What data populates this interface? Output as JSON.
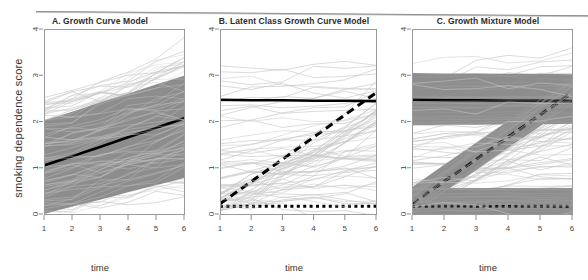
{
  "figure": {
    "width": 588,
    "height": 280,
    "background": "#ffffff",
    "band_color": "#8d8d8d",
    "spaghetti_color": "#c9c9c9",
    "mean_line_color": "#000000"
  },
  "panels": [
    {
      "id": "panel-a",
      "title": "A. Growth Curve Model",
      "xlabel": "time",
      "ylabel": "smoking dependence score"
    },
    {
      "id": "panel-b",
      "title": "B. Latent Class Growth Curve Model",
      "xlabel": "time",
      "ylabel": ""
    },
    {
      "id": "panel-c",
      "title": "C. Growth Mixture Model",
      "xlabel": "time",
      "ylabel": ""
    }
  ],
  "axes": {
    "x_ticks": [
      "1",
      "2",
      "3",
      "4",
      "5",
      "6"
    ],
    "y_ticks": [
      "0",
      "1",
      "2",
      "3",
      "4"
    ],
    "xlim": [
      1,
      6
    ],
    "ylim": [
      0,
      4
    ],
    "grid": false,
    "legend": "none"
  },
  "chart_data": {
    "type": "line",
    "xlabel": "time",
    "ylabel": "smoking dependence score",
    "x": [
      1,
      2,
      3,
      4,
      5,
      6
    ],
    "xlim": [
      1,
      6
    ],
    "ylim": [
      0,
      4
    ],
    "x_ticks": [
      1,
      2,
      3,
      4,
      5,
      6
    ],
    "y_ticks": [
      0,
      1,
      2,
      3,
      4
    ],
    "grid": false,
    "legend": "none",
    "panels": [
      {
        "label": "A",
        "title": "A. Growth Curve Model",
        "description": "Single average growth trajectory with a shaded band of individual variability around it.",
        "series": [
          {
            "name": "Overall mean trajectory",
            "style": "solid",
            "color": "#000000",
            "values": [
              1.05,
              1.25,
              1.45,
              1.66,
              1.86,
              2.07
            ]
          }
        ],
        "bands": [
          {
            "name": "Individual variation band (mean trajectory)",
            "color": "#8d8d8d",
            "lower": [
              0.0,
              0.16,
              0.31,
              0.47,
              0.62,
              0.78
            ],
            "upper": [
              2.02,
              2.21,
              2.41,
              2.6,
              2.8,
              2.99
            ]
          }
        ]
      },
      {
        "label": "B",
        "title": "B. Latent Class Growth Curve Model",
        "description": "Three latent class mean trajectories with no within-class variance band.",
        "series": [
          {
            "name": "Class 1 - stable high",
            "style": "solid",
            "color": "#000000",
            "values": [
              2.47,
              2.46,
              2.46,
              2.45,
              2.45,
              2.44
            ]
          },
          {
            "name": "Class 2 - increasing",
            "style": "dashed",
            "color": "#000000",
            "values": [
              0.22,
              0.7,
              1.18,
              1.66,
              2.14,
              2.62
            ]
          },
          {
            "name": "Class 3 - stable low",
            "style": "dotted",
            "color": "#000000",
            "values": [
              0.17,
              0.17,
              0.17,
              0.17,
              0.17,
              0.17
            ]
          }
        ],
        "bands": []
      },
      {
        "label": "C",
        "title": "C. Growth Mixture Model",
        "description": "Three latent class mean trajectories each with its own shaded within-class variability band.",
        "series": [
          {
            "name": "Class 1 - stable high",
            "style": "solid",
            "color": "#000000",
            "values": [
              2.47,
              2.46,
              2.46,
              2.45,
              2.45,
              2.44
            ]
          },
          {
            "name": "Class 2 - increasing",
            "style": "dashed",
            "color": "#000000",
            "values": [
              0.22,
              0.7,
              1.18,
              1.66,
              2.14,
              2.62
            ]
          },
          {
            "name": "Class 3 - stable low",
            "style": "dotted",
            "color": "#000000",
            "values": [
              0.17,
              0.17,
              0.17,
              0.17,
              0.17,
              0.17
            ]
          }
        ],
        "bands": [
          {
            "name": "Class 1 band",
            "color": "#8d8d8d",
            "lower": [
              1.92,
              1.93,
              1.93,
              1.94,
              1.94,
              1.95
            ],
            "upper": [
              3.05,
              3.04,
              3.04,
              3.03,
              3.03,
              3.02
            ]
          },
          {
            "name": "Class 2 band",
            "color": "#8d8d8d",
            "lower": [
              0.0,
              0.47,
              0.95,
              1.43,
              1.9,
              2.38
            ],
            "upper": [
              0.58,
              1.06,
              1.54,
              2.01,
              2.49,
              2.97
            ]
          },
          {
            "name": "Class 3 band",
            "color": "#8d8d8d",
            "lower": [
              -0.22,
              -0.21,
              -0.21,
              -0.2,
              -0.2,
              -0.19
            ],
            "upper": [
              0.56,
              0.56,
              0.56,
              0.56,
              0.56,
              0.56
            ]
          }
        ]
      }
    ]
  }
}
